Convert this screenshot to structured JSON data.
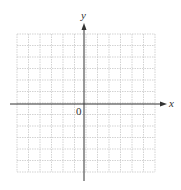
{
  "diagram": {
    "type": "coordinate-grid",
    "x_axis_label": "x",
    "y_axis_label": "y",
    "origin_label": "0",
    "grid": {
      "columns": 12,
      "rows": 12,
      "x0": 17,
      "y0": 34,
      "cell": 11.5
    },
    "colors": {
      "grid": "#c8c8c8",
      "axis": "#333333"
    }
  }
}
